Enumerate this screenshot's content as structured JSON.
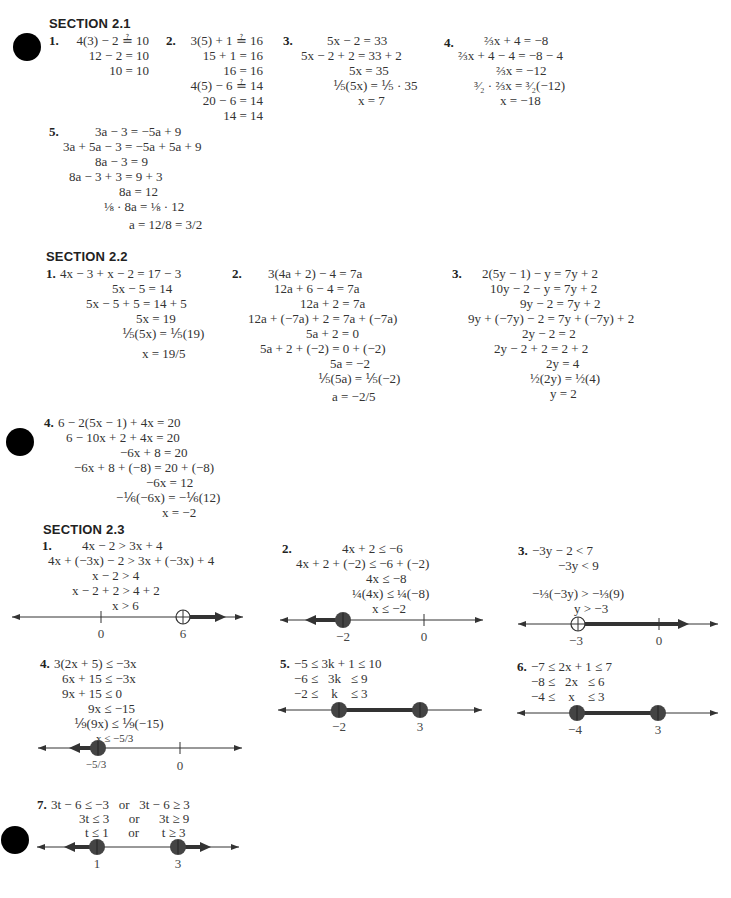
{
  "sections": [
    {
      "title": "SECTION 2.1",
      "problems": [
        {
          "num": "1.",
          "lines": [
            "4(3) − 2 ≟ 10",
            "12 − 2 = 10",
            "10 = 10"
          ]
        },
        {
          "num": "2.",
          "lines": [
            "3(5) + 1 ≟ 16",
            "15 + 1 = 16",
            "16 = 16",
            "4(5) − 6 ≟ 14",
            "20 − 6 = 14",
            "14 = 14"
          ]
        },
        {
          "num": "3.",
          "lines": [
            "5x − 2 = 33",
            "5x − 2 + 2 = 33 + 2",
            "5x = 35",
            "⅕(5x) = ⅕ · 35",
            "x = 7"
          ]
        },
        {
          "num": "4.",
          "lines": [
            "⅔x + 4 = −8",
            "⅔x + 4 − 4 = −8 − 4",
            "⅔x = −12",
            "³⁄₂ · ⅔x = ³⁄₂(−12)",
            "x = −18"
          ]
        },
        {
          "num": "5.",
          "lines": [
            "3a − 3 = −5a + 9",
            "3a + 5a − 3 = −5a + 5a + 9",
            "8a − 3 = 9",
            "8a − 3 + 3 = 9 + 3",
            "8a = 12",
            "⅛ · 8a = ⅛ · 12",
            "a = 12/8 = 3/2"
          ]
        }
      ]
    },
    {
      "title": "SECTION 2.2",
      "problems": [
        {
          "num": "1.",
          "lines": [
            "4x − 3 + x − 2 = 17 − 3",
            "5x − 5 = 14",
            "5x − 5 + 5 = 14 + 5",
            "5x = 19",
            "⅕(5x) = ⅕(19)",
            "x = 19/5"
          ]
        },
        {
          "num": "2.",
          "lines": [
            "3(4a + 2) − 4 = 7a",
            "12a + 6 − 4 = 7a",
            "12a + 2 = 7a",
            "12a + (−7a) + 2 = 7a + (−7a)",
            "5a + 2 = 0",
            "5a + 2 + (−2) = 0 + (−2)",
            "5a = −2",
            "⅕(5a) = ⅕(−2)",
            "a = −2/5"
          ]
        },
        {
          "num": "3.",
          "lines": [
            "2(5y − 1) − y = 7y + 2",
            "10y − 2 − y = 7y + 2",
            "9y − 2 = 7y + 2",
            "9y + (−7y) − 2 = 7y + (−7y) + 2",
            "2y − 2 = 2",
            "2y − 2 + 2 = 2 + 2",
            "2y = 4",
            "½(2y) = ½(4)",
            "y = 2"
          ]
        },
        {
          "num": "4.",
          "lines": [
            "6 − 2(5x − 1) + 4x = 20",
            "6 − 10x + 2 + 4x = 20",
            "−6x + 8 = 20",
            "−6x + 8 + (−8) = 20 + (−8)",
            "−6x = 12",
            "−⅙(−6x) = −⅙(12)",
            "x = −2"
          ]
        }
      ]
    },
    {
      "title": "SECTION 2.3",
      "problems": [
        {
          "num": "1.",
          "lines": [
            "4x − 2 > 3x + 4",
            "4x + (−3x) − 2 > 3x + (−3x) + 4",
            "x − 2 > 4",
            "x − 2 + 2 > 4 + 2",
            "x > 6"
          ],
          "number_line": {
            "ticks": [
              "0",
              "6"
            ],
            "point_type": "open",
            "shade": "right"
          }
        },
        {
          "num": "2.",
          "lines": [
            "4x + 2 ≤ −6",
            "4x + 2 + (−2) ≤ −6 + (−2)",
            "4x ≤ −8",
            "¼(4x) ≤ ¼(−8)",
            "x ≤ −2"
          ],
          "number_line": {
            "ticks": [
              "−2",
              "0"
            ],
            "point_type": "closed",
            "shade": "left"
          }
        },
        {
          "num": "3.",
          "lines": [
            "−3y − 2 < 7",
            "−3y < 9",
            "",
            "−⅓(−3y) > −⅓(9)",
            "y > −3"
          ],
          "number_line": {
            "ticks": [
              "−3",
              "0"
            ],
            "point_type": "open",
            "shade": "right"
          }
        },
        {
          "num": "4.",
          "lines": [
            "3(2x + 5) ≤ −3x",
            "6x + 15 ≤ −3x",
            "9x + 15 ≤ 0",
            "9x ≤ −15",
            "⅑(9x) ≤ ⅑(−15)",
            "x ≤ −5/3"
          ],
          "number_line": {
            "ticks": [
              "−5/3",
              "0"
            ],
            "point_type": "closed",
            "shade": "left"
          }
        },
        {
          "num": "5.",
          "lines": [
            "−5 ≤ 3k + 1 ≤ 10",
            "−6 ≤   3k   ≤ 9",
            "−2 ≤    k    ≤ 3"
          ],
          "number_line": {
            "ticks": [
              "−2",
              "3"
            ],
            "point_type": "closed",
            "shade": "between"
          }
        },
        {
          "num": "6.",
          "lines": [
            "−7 ≤ 2x + 1 ≤ 7",
            "−8 ≤   2x   ≤ 6",
            "−4 ≤    x    ≤ 3"
          ],
          "number_line": {
            "ticks": [
              "−4",
              "3"
            ],
            "point_type": "closed",
            "shade": "between"
          }
        },
        {
          "num": "7.",
          "lines": [
            "3t − 6 ≤ −3   or   3t − 6 ≥ 3",
            "3t ≤ 3      or      3t ≥ 9",
            "t ≤ 1      or       t ≥ 3"
          ],
          "number_line": {
            "ticks": [
              "1",
              "3"
            ],
            "point_type": "closed",
            "shade": "outside"
          }
        }
      ]
    }
  ]
}
